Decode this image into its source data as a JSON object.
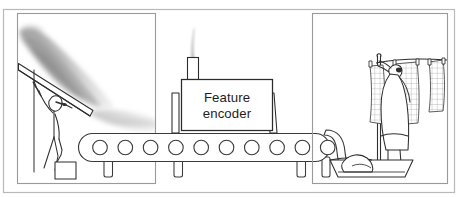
{
  "figure": {
    "canvas": {
      "width": 469,
      "height": 197
    },
    "style": "hand-drawn line art, grayscale"
  },
  "outer_frame": {
    "name": "outer-border",
    "stroke": "#b9b9b9",
    "x": 3,
    "y": 9,
    "width": 452,
    "height": 184
  },
  "panels": [
    {
      "id": "left-panel",
      "name": "input-scene-panel",
      "description": "Person under a heap of dark raw material holding a bucket",
      "stroke": "#9a9a9a",
      "x": 17,
      "y": 13,
      "width": 139,
      "height": 171
    },
    {
      "id": "right-panel",
      "name": "output-scene-panel",
      "description": "Person hanging checkered laundry on a clothesline above a basket",
      "stroke": "#9a9a9a",
      "x": 312,
      "y": 13,
      "width": 136,
      "height": 171
    }
  ],
  "machine": {
    "name": "feature-encoder-machine",
    "label_line1": "Feature",
    "label_line2": "encoder",
    "body": {
      "x": 181,
      "y": 79,
      "width": 91,
      "height": 51
    },
    "chimney": {
      "x": 187,
      "y": 57,
      "width": 11,
      "height": 22
    },
    "smoke": {
      "description": "thin pale smoke plume rising from chimney",
      "color": "#d8d8d8"
    },
    "stroke": "#2b2b2b",
    "fill": "#ffffff"
  },
  "conveyor": {
    "name": "conveyor-belt",
    "description": "Horizontal belt with ten circular rollers running left to right, curving down into the basket",
    "belt": {
      "x": 78,
      "y": 133,
      "width": 250,
      "height": 28,
      "radius": 14
    },
    "roller_count": 10,
    "roller_radius": 7.2,
    "roller_first_cx": 100,
    "roller_spacing": 25.3,
    "legs": [
      {
        "x": 104,
        "y": 161,
        "width": 8,
        "height": 18
      },
      {
        "x": 174,
        "y": 161,
        "width": 8,
        "height": 18
      },
      {
        "x": 230,
        "y": 161,
        "width": 8,
        "height": 18
      },
      {
        "x": 297,
        "y": 161,
        "width": 8,
        "height": 18
      },
      {
        "x": 322,
        "y": 161,
        "width": 8,
        "height": 18
      }
    ],
    "stroke": "#3a3a3a"
  },
  "left_scene": {
    "pile": {
      "name": "raw-material-pile",
      "description": "Diagonal cloud of smudged dark grey material sloping down to the right",
      "color_dark": "#8e8e8e",
      "color_light": "#d6d6d6"
    },
    "ramp": {
      "name": "ramp-plank",
      "description": "Long diagonal plank / chute under the pile",
      "stroke": "#2e2e2e"
    },
    "person": {
      "name": "worker-figure",
      "description": "Stick figure standing under the ramp holding a bucket",
      "stroke": "#2e2e2e"
    },
    "bucket": {
      "name": "bucket",
      "description": "Small square bucket hanging from the worker's hand",
      "stroke": "#2e2e2e"
    }
  },
  "right_scene": {
    "clothesline": {
      "name": "clothesline",
      "description": "Rope strung between posts with clothespins",
      "stroke": "#2e2e2e"
    },
    "garments": [
      {
        "name": "hanging-cloth-1",
        "pattern": "grid"
      },
      {
        "name": "hanging-cloth-2",
        "pattern": "grid"
      },
      {
        "name": "hanging-cloth-3",
        "pattern": "grid"
      }
    ],
    "person": {
      "name": "laundry-figure",
      "description": "Figure with raised arm pinning cloth to the line",
      "stroke": "#2e2e2e"
    },
    "basket": {
      "name": "laundry-basket",
      "description": "Shallow basin catching items from the conveyor",
      "stroke": "#2e2e2e"
    }
  },
  "colors": {
    "frame": "#b9b9b9",
    "panel_border": "#9a9a9a",
    "ink": "#2e2e2e",
    "smoke": "#d8d8d8",
    "pile_dark": "#8e8e8e",
    "paper": "#ffffff"
  }
}
